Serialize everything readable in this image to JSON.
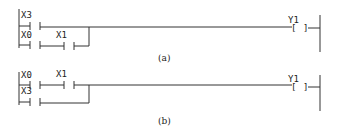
{
  "diagrams": [
    {
      "id": "a",
      "caption": "(a)",
      "branches": [
        {
          "contact": "X3"
        },
        {
          "contact": "X0",
          "series_contact": "X1"
        }
      ],
      "coil": "Y1",
      "coil_symbol_open": "[",
      "coil_symbol_close": "]"
    },
    {
      "id": "b",
      "caption": "(b)",
      "branches": [
        {
          "contact": "X0",
          "series_contact": "X1"
        },
        {
          "contact": "X3"
        }
      ],
      "coil": "Y1",
      "coil_symbol_open": "[",
      "coil_symbol_close": "]"
    }
  ]
}
